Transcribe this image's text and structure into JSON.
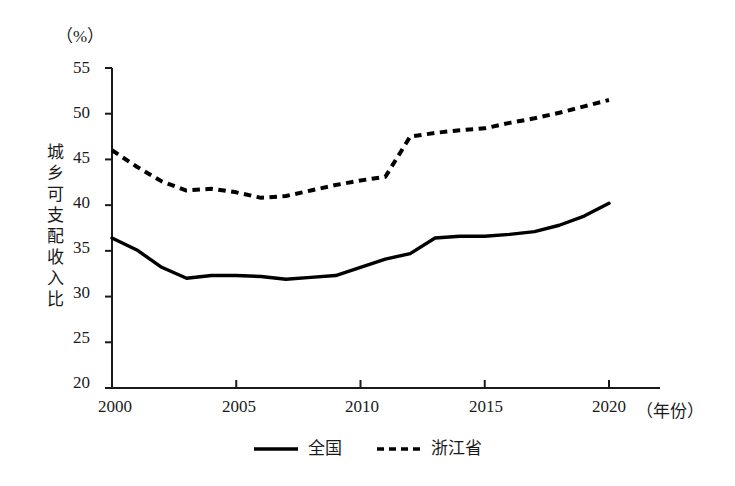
{
  "axes": {
    "unit_label": "（%）",
    "y_title": "城乡可支配收入比",
    "y_ticks": [
      "20",
      "25",
      "30",
      "35",
      "40",
      "45",
      "50",
      "55"
    ],
    "x_ticks": [
      "2000",
      "2005",
      "2010",
      "2015",
      "2020"
    ],
    "x_unit_label": "（年份）"
  },
  "legend": {
    "items": [
      {
        "label": "全国",
        "style": "solid",
        "color": "#000000"
      },
      {
        "label": "浙江省",
        "style": "dashed",
        "color": "#000000"
      }
    ]
  },
  "chart_data": {
    "type": "line",
    "title": "",
    "xlabel": "（年份）",
    "ylabel": "城乡可支配收入比",
    "unit": "%",
    "xlim": [
      2000,
      2020
    ],
    "ylim": [
      20,
      55
    ],
    "y_ticks": [
      20,
      25,
      30,
      35,
      40,
      45,
      50,
      55
    ],
    "x_ticks": [
      2000,
      2005,
      2010,
      2015,
      2020
    ],
    "grid": false,
    "legend_position": "bottom",
    "x": [
      2000,
      2001,
      2002,
      2003,
      2004,
      2005,
      2006,
      2007,
      2008,
      2009,
      2010,
      2011,
      2012,
      2013,
      2014,
      2015,
      2016,
      2017,
      2018,
      2019,
      2020
    ],
    "series": [
      {
        "name": "全国",
        "style": "solid",
        "color": "#000000",
        "values": [
          36.4,
          35.1,
          33.2,
          32.0,
          32.3,
          32.3,
          32.2,
          31.9,
          32.1,
          32.3,
          33.2,
          34.1,
          34.7,
          36.4,
          36.6,
          36.6,
          36.8,
          37.1,
          37.8,
          38.8,
          40.2
        ]
      },
      {
        "name": "浙江省",
        "style": "dashed",
        "color": "#000000",
        "values": [
          46.0,
          44.2,
          42.6,
          41.6,
          41.8,
          41.4,
          40.8,
          41.0,
          41.6,
          42.2,
          42.7,
          43.1,
          47.5,
          47.9,
          48.2,
          48.4,
          49.0,
          49.5,
          50.1,
          50.8,
          51.5
        ]
      }
    ],
    "annotations": []
  }
}
